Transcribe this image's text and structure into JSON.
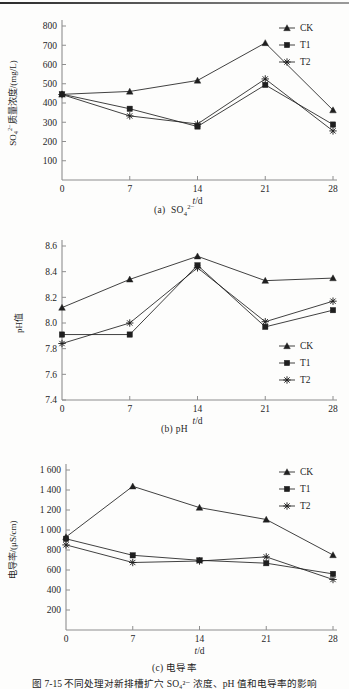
{
  "page": {
    "main_caption": "图 7-15   不同处理对新排槽扩穴 SO₄²⁻ 浓度、pH 值和电导率的影响",
    "background": "#fdfdfc",
    "ink": "#1f1f1f"
  },
  "series_names": [
    "CK",
    "T1",
    "T2"
  ],
  "markers": {
    "CK": "triangle",
    "T1": "square",
    "T2": "asterisk"
  },
  "legend": {
    "ck_label": "CK",
    "t1_label": "T1",
    "t2_label": "T2"
  },
  "axis": {
    "x_label": "t/d",
    "x_ticks": [
      "0",
      "7",
      "14",
      "21",
      "28"
    ]
  },
  "captions": {
    "a": "(a)  SO₄²⁻",
    "b": "(b)  pH",
    "c": "(c)  电导率"
  },
  "chart_data": [
    {
      "id": "a",
      "type": "line",
      "title": "(a)  SO₄²⁻",
      "xlabel": "t/d",
      "ylabel": "SO₄²⁻质量浓度/(mg/L)",
      "x": [
        0,
        7,
        14,
        21,
        28
      ],
      "xticklabels": [
        "0",
        "7",
        "14",
        "21",
        "28"
      ],
      "yticklabels": [
        "100",
        "200",
        "300",
        "400",
        "500",
        "600",
        "700",
        "800"
      ],
      "ylim": [
        0,
        800
      ],
      "ytick_step": 100,
      "grid": false,
      "legend_position": "top-right",
      "series": [
        {
          "name": "CK",
          "marker": "triangle",
          "values": [
            445,
            460,
            517,
            712,
            363
          ]
        },
        {
          "name": "T1",
          "marker": "square",
          "values": [
            446,
            370,
            278,
            494,
            288
          ]
        },
        {
          "name": "T2",
          "marker": "asterisk",
          "values": [
            444,
            333,
            291,
            525,
            255
          ]
        }
      ]
    },
    {
      "id": "b",
      "type": "line",
      "title": "(b)  pH",
      "xlabel": "t/d",
      "ylabel": "pH值",
      "x": [
        0,
        7,
        14,
        21,
        28
      ],
      "xticklabels": [
        "0",
        "7",
        "14",
        "21",
        "28"
      ],
      "yticklabels": [
        "7.4",
        "7.6",
        "7.8",
        "8.0",
        "8.2",
        "8.4",
        "8.6"
      ],
      "ylim": [
        7.4,
        8.6
      ],
      "ytick_step": 0.2,
      "grid": false,
      "legend_position": "bottom-right",
      "series": [
        {
          "name": "CK",
          "marker": "triangle",
          "values": [
            8.12,
            8.34,
            8.52,
            8.33,
            8.35
          ]
        },
        {
          "name": "T1",
          "marker": "square",
          "values": [
            7.91,
            7.91,
            8.45,
            7.97,
            8.1
          ]
        },
        {
          "name": "T2",
          "marker": "asterisk",
          "values": [
            7.84,
            8.0,
            8.43,
            8.01,
            8.17
          ]
        }
      ]
    },
    {
      "id": "c",
      "type": "line",
      "title": "(c)  电导率",
      "xlabel": "t/d",
      "ylabel": "电导率/(μS/cm)",
      "x": [
        0,
        7,
        14,
        21,
        28
      ],
      "xticklabels": [
        "0",
        "7",
        "14",
        "21",
        "28"
      ],
      "yticklabels": [
        "200",
        "400",
        "600",
        "800",
        "1 000",
        "1 200",
        "1 400",
        "1 600"
      ],
      "ylim": [
        0,
        1600
      ],
      "ytick_step": 200,
      "grid": false,
      "legend_position": "top-right",
      "series": [
        {
          "name": "CK",
          "marker": "triangle",
          "values": [
            930,
            1437,
            1224,
            1105,
            750
          ]
        },
        {
          "name": "T1",
          "marker": "square",
          "values": [
            912,
            747,
            697,
            668,
            561
          ]
        },
        {
          "name": "T2",
          "marker": "asterisk",
          "values": [
            851,
            675,
            690,
            731,
            505
          ]
        }
      ]
    }
  ]
}
